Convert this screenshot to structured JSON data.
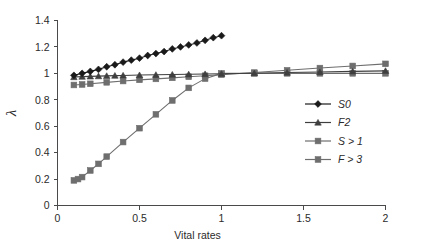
{
  "chart_data": {
    "type": "line",
    "title": "",
    "xlabel": "Vital rates",
    "ylabel": "λ",
    "xlim": [
      0,
      2
    ],
    "ylim": [
      0,
      1.4
    ],
    "xticks": [
      "0",
      "0.5",
      "1",
      "1.5",
      "2"
    ],
    "xtick_values": [
      0,
      0.5,
      1,
      1.5,
      2
    ],
    "yticks": [
      "0",
      "0.2",
      "0.4",
      "0.6",
      "0.8",
      "1",
      "1.2",
      "1.4"
    ],
    "ytick_values": [
      0,
      0.2,
      0.4,
      0.6,
      0.8,
      1.0,
      1.2,
      1.4
    ],
    "grid": false,
    "legend_position": "right-middle",
    "series": [
      {
        "name": "S0",
        "marker": "diamond",
        "color": "#1a1a1a",
        "x": [
          0.1,
          0.15,
          0.2,
          0.25,
          0.3,
          0.35,
          0.4,
          0.45,
          0.5,
          0.55,
          0.6,
          0.65,
          0.7,
          0.75,
          0.8,
          0.85,
          0.9,
          0.95,
          1.0
        ],
        "values": [
          0.985,
          1.0,
          1.015,
          1.03,
          1.05,
          1.065,
          1.085,
          1.1,
          1.115,
          1.135,
          1.15,
          1.165,
          1.185,
          1.2,
          1.215,
          1.23,
          1.25,
          1.27,
          1.285
        ]
      },
      {
        "name": "F2",
        "marker": "triangle",
        "color": "#3f3f3f",
        "x": [
          0.1,
          0.15,
          0.2,
          0.25,
          0.3,
          0.35,
          0.4,
          0.5,
          0.6,
          0.7,
          0.8,
          0.9,
          1.0,
          1.2,
          1.4,
          1.6,
          1.8,
          2.0
        ],
        "values": [
          0.972,
          0.975,
          0.977,
          0.979,
          0.981,
          0.983,
          0.984,
          0.987,
          0.989,
          0.991,
          0.993,
          0.995,
          0.997,
          1.001,
          1.006,
          1.01,
          1.015,
          1.019
        ]
      },
      {
        "name": "S > 1",
        "marker": "square",
        "color": "#6e6e6e",
        "x": [
          0.1,
          0.15,
          0.2,
          0.3,
          0.4,
          0.5,
          0.6,
          0.7,
          0.8,
          0.9,
          1.0,
          1.2,
          1.4,
          1.6,
          1.8,
          2.0
        ],
        "values": [
          0.912,
          0.916,
          0.921,
          0.932,
          0.942,
          0.951,
          0.958,
          0.966,
          0.974,
          0.982,
          0.99,
          1.006,
          1.023,
          1.04,
          1.056,
          1.072
        ]
      },
      {
        "name": "F > 3",
        "marker": "square",
        "color": "#6e6e6e",
        "x": [
          0.1,
          0.125,
          0.15,
          0.2,
          0.25,
          0.3,
          0.4,
          0.5,
          0.6,
          0.7,
          0.8,
          0.9,
          1.0,
          1.2,
          1.4,
          1.6,
          1.8,
          2.0
        ],
        "values": [
          0.19,
          0.2,
          0.215,
          0.265,
          0.315,
          0.37,
          0.48,
          0.585,
          0.69,
          0.795,
          0.89,
          0.96,
          1.0,
          1.0,
          1.0,
          1.0,
          1.0,
          1.0
        ]
      }
    ]
  },
  "legend": {
    "items": [
      {
        "label": "S0"
      },
      {
        "label": "F2"
      },
      {
        "label": "S > 1"
      },
      {
        "label": "F > 3"
      }
    ]
  }
}
